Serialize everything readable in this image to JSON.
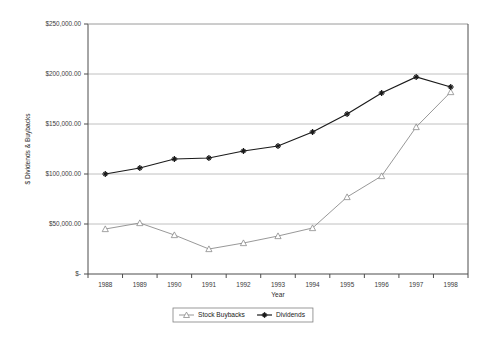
{
  "chart_data": {
    "type": "line",
    "title": "",
    "xlabel": "Year",
    "ylabel": "$ Dividends & Buybacks",
    "categories": [
      "1988",
      "1989",
      "1990",
      "1991",
      "1992",
      "1993",
      "1994",
      "1995",
      "1996",
      "1997",
      "1998"
    ],
    "ylim": [
      0,
      250000
    ],
    "ytick_values": [
      0,
      50000,
      100000,
      150000,
      200000,
      250000
    ],
    "ytick_labels": [
      "$-",
      "$50,000.00",
      "$100,000.00",
      "$150,000.00",
      "$200,000.00",
      "$250,000.00"
    ],
    "grid": true,
    "legend_position": "bottom",
    "series": [
      {
        "name": "Stock Buybacks",
        "marker": "triangle",
        "color": "#8c8c8c",
        "values": [
          45000,
          51000,
          39000,
          25000,
          31000,
          38000,
          46000,
          77000,
          98000,
          147000,
          182000
        ]
      },
      {
        "name": "Dividends",
        "marker": "asterisk",
        "color": "#1a1a1a",
        "values": [
          100000,
          106000,
          115000,
          116000,
          123000,
          128000,
          142000,
          160000,
          181000,
          197000,
          187000
        ]
      }
    ]
  },
  "legend": {
    "items": [
      {
        "label": "Stock Buybacks"
      },
      {
        "label": "Dividends"
      }
    ]
  },
  "axes": {
    "x_title": "Year",
    "y_title": "$ Dividends & Buybacks"
  }
}
